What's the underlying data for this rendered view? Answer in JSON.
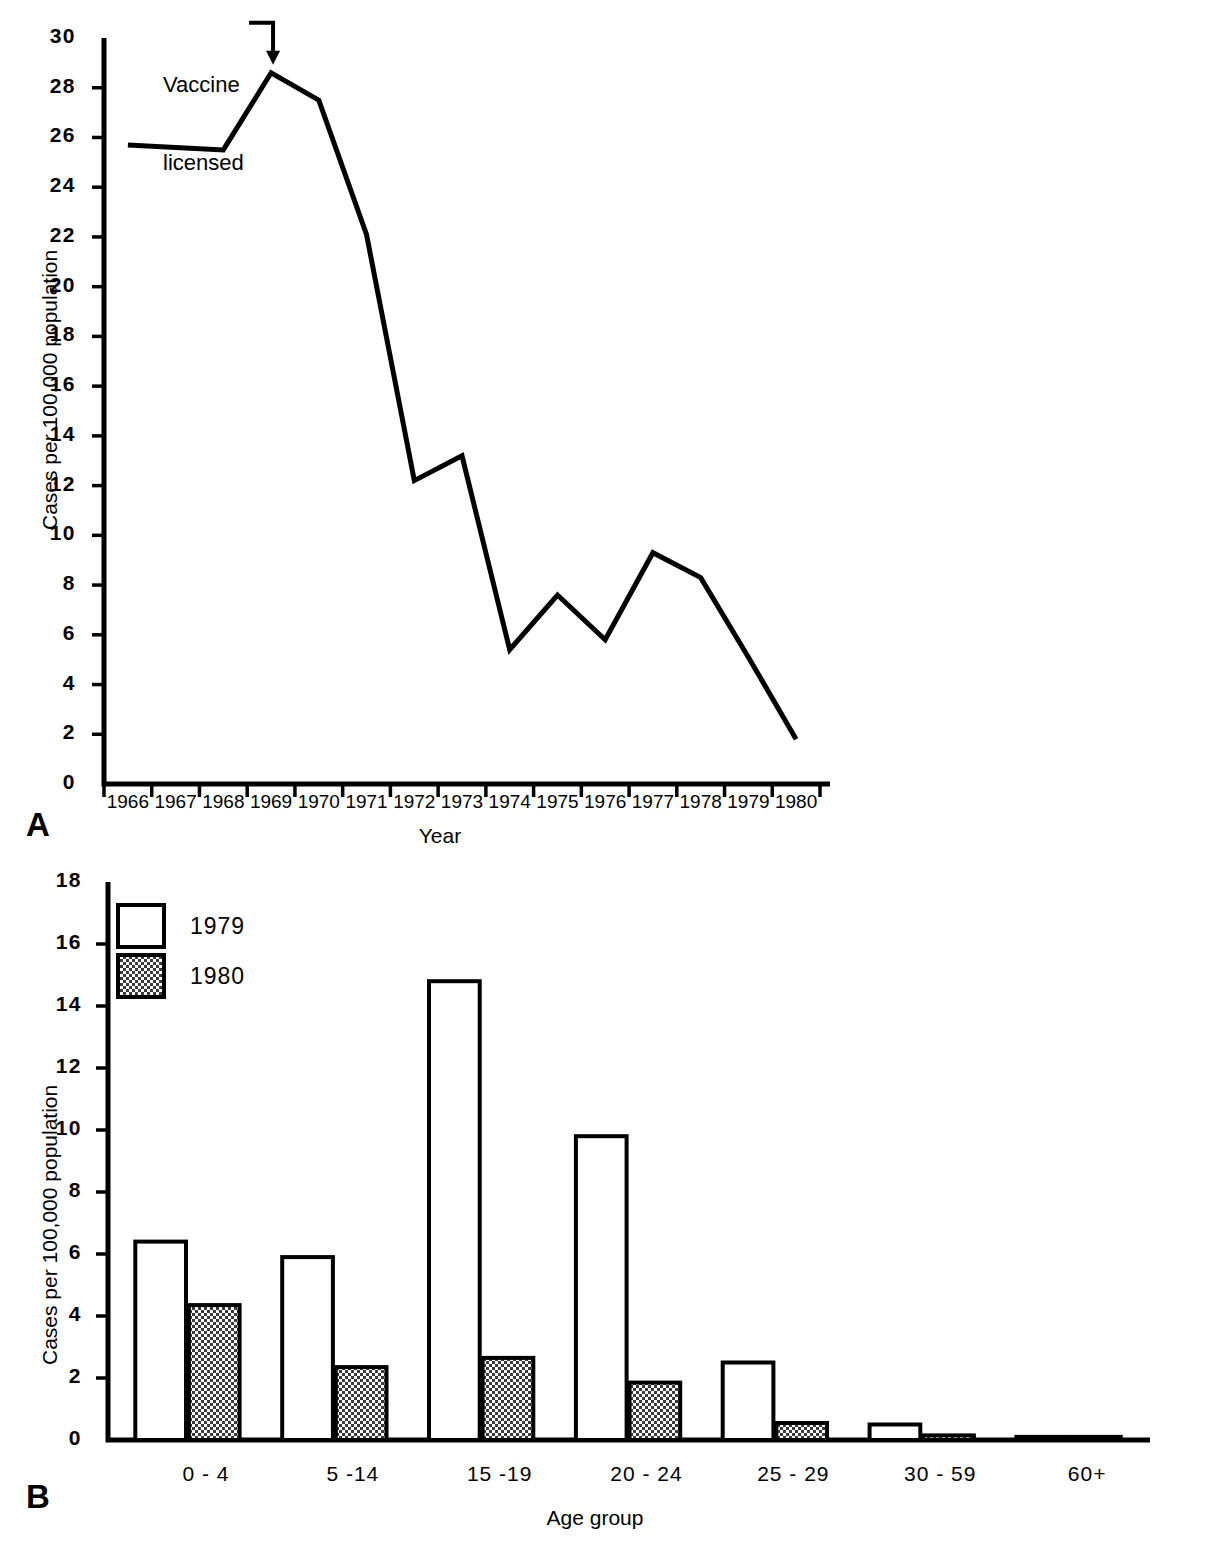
{
  "figure": {
    "panel_a_letter": "A",
    "panel_b_letter": "B"
  },
  "panel_a": {
    "ylabel": "Cases per 100,000 population",
    "xlabel": "Year",
    "annotation": "Vaccine\nlicensed",
    "annotation_line1": "Vaccine",
    "annotation_line2": "licensed",
    "annotation_icon": "curved-down-arrow-icon",
    "ytick_labels": [
      "0",
      "2",
      "4",
      "6",
      "8",
      "10",
      "12",
      "14",
      "16",
      "18",
      "20",
      "22",
      "24",
      "26",
      "28",
      "30"
    ],
    "xtick_labels": [
      "1966",
      "1967",
      "1968",
      "1969",
      "1970",
      "1971",
      "1972",
      "1973",
      "1974",
      "1975",
      "1976",
      "1977",
      "1978",
      "1979",
      "1980"
    ]
  },
  "panel_b": {
    "ylabel": "Cases per 100,000 population",
    "xlabel": "Age group",
    "ytick_labels": [
      "0",
      "2",
      "4",
      "6",
      "8",
      "10",
      "12",
      "14",
      "16",
      "18"
    ],
    "legend": [
      {
        "label": "1979",
        "swatch": "open-white-square"
      },
      {
        "label": "1980",
        "swatch": "checkered-square"
      }
    ],
    "age_labels": [
      "0 - 4",
      "5 -14",
      "15 -19",
      "20 - 24",
      "25 - 29",
      "30 - 59",
      "60+"
    ]
  },
  "colors": {
    "ink": "#000000",
    "background": "#ffffff",
    "bar_1979_fill": "#ffffff",
    "bar_1980_fill": "#4a4a4a"
  },
  "chart_data": [
    {
      "type": "line",
      "panel": "A",
      "title": "",
      "xlabel": "Year",
      "ylabel": "Cases per 100,000 population",
      "x": [
        1966,
        1967,
        1968,
        1969,
        1970,
        1971,
        1972,
        1973,
        1974,
        1975,
        1976,
        1977,
        1978,
        1979,
        1980
      ],
      "values": [
        25.7,
        25.6,
        25.5,
        28.6,
        27.5,
        22.1,
        12.2,
        13.2,
        5.4,
        7.6,
        5.8,
        9.3,
        8.3,
        5.1,
        1.8
      ],
      "ylim": [
        0,
        30
      ],
      "ytick_step": 2,
      "grid": false,
      "legend": "none",
      "annotations": [
        {
          "text": "Vaccine licensed",
          "x": 1969,
          "y": 28.6
        }
      ]
    },
    {
      "type": "bar",
      "panel": "B",
      "title": "",
      "xlabel": "Age group",
      "ylabel": "Cases per 100,000 population",
      "categories": [
        "0 - 4",
        "5 -14",
        "15 -19",
        "20 - 24",
        "25 - 29",
        "30 - 59",
        "60+"
      ],
      "series": [
        {
          "name": "1979",
          "values": [
            6.4,
            5.9,
            14.8,
            9.8,
            2.5,
            0.5,
            0.1
          ]
        },
        {
          "name": "1980",
          "values": [
            4.35,
            2.35,
            2.65,
            1.85,
            0.55,
            0.15,
            0.1
          ]
        }
      ],
      "ylim": [
        0,
        18
      ],
      "ytick_step": 2,
      "grid": false,
      "legend": "upper-left"
    }
  ]
}
